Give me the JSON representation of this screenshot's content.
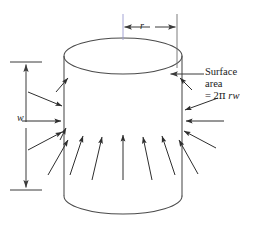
{
  "figure": {
    "background": "#ffffff",
    "stroke_color": "#4a4a4a",
    "text_color": "#1a1a1a",
    "axis_colors": {
      "top": "#8b90d0",
      "middle": "#a85c66",
      "bottom": "#9ec3a8"
    },
    "edge_highlight_color": "#8b8bd8"
  },
  "labels": {
    "surface_line1": "Surface",
    "surface_line2": "area",
    "formula_prefix": "= 2",
    "formula_pi": "π",
    "formula_vars": " rw",
    "radius": "r",
    "width": "w"
  },
  "geometry": {
    "cylinder": {
      "center_x": 123,
      "top_ellipse_cy": 56,
      "bottom_ellipse_cy": 196,
      "rx": 59,
      "ry": 18,
      "left_x": 64,
      "right_x": 182
    },
    "axis": {
      "x": 123,
      "y_top": 12,
      "y_bottom": 238
    },
    "width_dimension": {
      "x": 26,
      "y_top": 62,
      "y_bottom": 190,
      "tick_half_width": 16
    },
    "radius_dimension": {
      "y": 27,
      "x_left": 123,
      "x_right": 177
    }
  },
  "arrows": {
    "description": "inward-pointing field arrows converging on the cylinder",
    "count": 16
  }
}
